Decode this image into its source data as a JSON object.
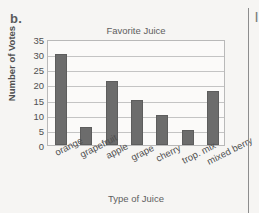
{
  "page": {
    "item_letter": "b.",
    "divider_glyph": "|"
  },
  "chart_data": {
    "type": "bar",
    "title": "Favorite Juice",
    "xlabel": "Type of Juice",
    "ylabel": "Number of Votes",
    "categories": [
      "orange",
      "grapefruit",
      "apple",
      "grape",
      "cherry",
      "trop. mix",
      "mixed berry"
    ],
    "values": [
      30,
      6,
      21,
      15,
      10,
      5,
      18
    ],
    "ylim": [
      0,
      35
    ],
    "ytick_labels": [
      "0",
      "5",
      "10",
      "15",
      "20",
      "25",
      "30",
      "35"
    ],
    "ytick_values": [
      0,
      5,
      10,
      15,
      20,
      25,
      30,
      35
    ],
    "grid": true,
    "legend": "none",
    "bar_color": "#6c6c6c",
    "plot_bg": "#fbfaf9",
    "axis_color": "#b9b9b9",
    "grid_color": "#c4c4c4",
    "page_bg": "#f6f5f3"
  }
}
